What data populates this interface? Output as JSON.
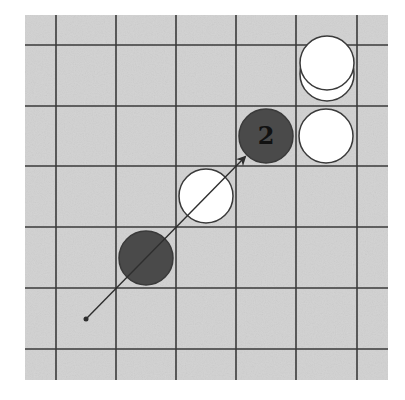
{
  "diagram": {
    "type": "go-board-fragment",
    "colors": {
      "board": "#d2d2d2",
      "grid_line": "#3a3a3a",
      "black_stone": "#4a4a4a",
      "white_stone": "#ffffff",
      "stone_outline": "#3a3a3a",
      "label": "#111111",
      "arrow": "#2e2e2e"
    },
    "board": {
      "x": 25,
      "y": 15,
      "width": 363,
      "height": 365,
      "vertical_lines_x": [
        56,
        116,
        176,
        236,
        296,
        357
      ],
      "horizontal_lines_y": [
        45,
        106,
        166,
        227,
        288,
        349
      ]
    },
    "stones": [
      {
        "id": "white-stacked-lower",
        "color": "white",
        "cx": 327,
        "cy": 74,
        "r": 27,
        "label": ""
      },
      {
        "id": "white-stacked-upper",
        "color": "white",
        "cx": 327,
        "cy": 63,
        "r": 27,
        "label": ""
      },
      {
        "id": "white-right",
        "color": "white",
        "cx": 326,
        "cy": 136,
        "r": 27,
        "label": ""
      },
      {
        "id": "black-numbered",
        "color": "black",
        "cx": 266,
        "cy": 136,
        "r": 27,
        "label": "2"
      },
      {
        "id": "white-middle",
        "color": "white",
        "cx": 206,
        "cy": 196,
        "r": 27,
        "label": ""
      },
      {
        "id": "black-lower",
        "color": "black",
        "cx": 146,
        "cy": 258,
        "r": 27,
        "label": ""
      }
    ],
    "arrow": {
      "start": {
        "x": 86,
        "y": 319
      },
      "end": {
        "x": 245,
        "y": 157
      }
    }
  }
}
